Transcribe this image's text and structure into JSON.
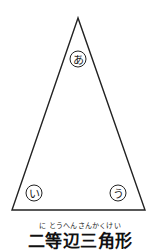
{
  "diagram": {
    "shape": "isosceles-triangle",
    "vertices": {
      "apex": {
        "label": "あ",
        "x": 78,
        "y": 18
      },
      "bottom_left": {
        "label": "い",
        "x": 12,
        "y": 210
      },
      "bottom_right": {
        "label": "う",
        "x": 145,
        "y": 210
      }
    },
    "labels": [
      {
        "text": "あ",
        "cx": 78,
        "cy": 59
      },
      {
        "text": "い",
        "cx": 34,
        "cy": 193
      },
      {
        "text": "う",
        "cx": 118,
        "cy": 193
      }
    ],
    "stroke_color": "#222222"
  },
  "caption": {
    "ruby": "に とうへんさんかくけい",
    "title": "二等辺三角形"
  }
}
